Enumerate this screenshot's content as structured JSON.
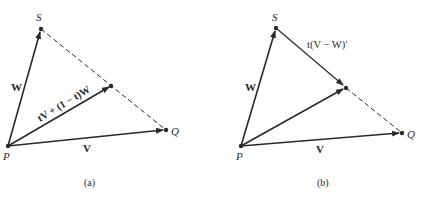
{
  "figure": {
    "panel_a": {
      "caption": "(a)",
      "points": {
        "P": {
          "label": "P"
        },
        "S": {
          "label": "S"
        },
        "Q": {
          "label": "Q"
        }
      },
      "vector_labels": {
        "W": "W",
        "V": "V",
        "combo": "tV + (1 − t)W"
      }
    },
    "panel_b": {
      "caption": "(b)",
      "points": {
        "P": {
          "label": "P"
        },
        "S": {
          "label": "S"
        },
        "Q": {
          "label": "Q"
        }
      },
      "vector_labels": {
        "W": "W",
        "V": "V",
        "diff": "t(V − W)'"
      }
    },
    "colors": {
      "ink": "#2a2a2a",
      "background": "#ffffff"
    }
  }
}
